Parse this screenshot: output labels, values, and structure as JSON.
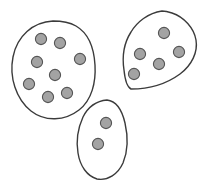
{
  "figure": {
    "background_color": "#ffffff",
    "width": 211,
    "height": 189,
    "outline_color": "#3b3b3b",
    "outline_fill": "#ffffff",
    "dot_fill_color": "#a3a3a3",
    "dot_stroke_color": "#555555",
    "dot_radius": 5.6,
    "total_dot_count": 15,
    "group_count": 3
  },
  "chart_data": {
    "type": "scatter",
    "xlabel": "",
    "ylabel": "",
    "grid": false,
    "legend": false,
    "xlim": [
      0,
      211
    ],
    "ylim": [
      0,
      189
    ],
    "groups": [
      {
        "name": "left-cluster",
        "dot_count": 8,
        "bounds": {
          "x": 11,
          "y": 21,
          "width": 85,
          "height": 98
        },
        "outline_path": "M 53 21 C 33 22 17 36 13 57 C 9 77 16 99 31 111 C 45 122 65 121 79 110 C 92 100 96 82 95 65 C 94 48 88 33 76 26 C 69 22 61 21 53 21 Z",
        "points": [
          {
            "x": 41,
            "y": 39
          },
          {
            "x": 60,
            "y": 43
          },
          {
            "x": 37,
            "y": 62
          },
          {
            "x": 80,
            "y": 59
          },
          {
            "x": 55,
            "y": 75
          },
          {
            "x": 29,
            "y": 84
          },
          {
            "x": 48,
            "y": 97
          },
          {
            "x": 67,
            "y": 93
          }
        ]
      },
      {
        "name": "top-right-cluster",
        "dot_count": 5,
        "bounds": {
          "x": 122,
          "y": 11,
          "width": 76,
          "height": 79
        },
        "outline_path": "M 162 11 C 148 13 137 22 131 32 C 124 43 122 57 124 70 C 125 80 127 87 131 89 C 146 89 165 85 180 74 C 192 65 198 52 196 40 C 194 28 184 17 172 13 C 169 12 165 11 162 11 Z",
        "points": [
          {
            "x": 164,
            "y": 33
          },
          {
            "x": 140,
            "y": 54
          },
          {
            "x": 179,
            "y": 52
          },
          {
            "x": 159,
            "y": 64
          },
          {
            "x": 134,
            "y": 74
          }
        ]
      },
      {
        "name": "bottom-center-cluster",
        "dot_count": 2,
        "bounds": {
          "x": 76,
          "y": 99,
          "width": 52,
          "height": 81
        },
        "outline_path": "M 107 100 C 96 101 88 107 83 117 C 78 128 76 141 78 153 C 80 166 87 176 97 179 C 108 181 118 174 123 163 C 128 151 128 136 125 123 C 122 110 116 101 107 100 Z",
        "points": [
          {
            "x": 106,
            "y": 123
          },
          {
            "x": 98,
            "y": 144
          }
        ]
      }
    ]
  }
}
